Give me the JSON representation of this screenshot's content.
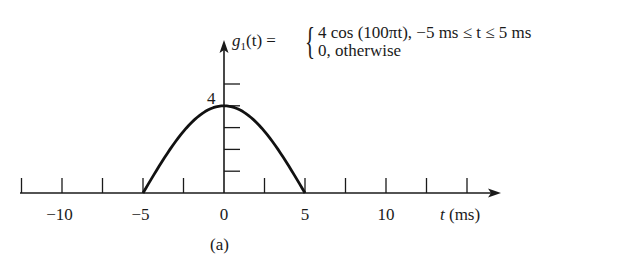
{
  "chart_data": {
    "type": "line",
    "title": "",
    "caption": "(a)",
    "xlabel": "t (ms)",
    "ylabel": "g1(t)",
    "formula": {
      "lhs": "g1(t) =",
      "cases": [
        "4 cos (100πt), −5 ms ≤ t ≤ 5 ms",
        "0, otherwise"
      ]
    },
    "x_ticks": [
      -12.5,
      -10,
      -7.5,
      -5,
      -2.5,
      0,
      2.5,
      5,
      7.5,
      10,
      12.5,
      15
    ],
    "x_tick_labels": [
      "−10",
      "−5",
      "0",
      "5",
      "10"
    ],
    "x_tick_label_values": [
      -10,
      -5,
      0,
      5,
      10
    ],
    "y_ticks": [
      1,
      2,
      3,
      4,
      5
    ],
    "y_tick_labels": [
      "4"
    ],
    "xlim": [
      -12.5,
      16.5
    ],
    "ylim": [
      0,
      6.8
    ],
    "series": [
      {
        "name": "g1(t)",
        "x": [
          -12.5,
          -5,
          -4,
          -3,
          -2,
          -1,
          0,
          1,
          2,
          3,
          4,
          5,
          16.5
        ],
        "values": [
          0,
          0,
          1.236,
          2.351,
          3.236,
          3.804,
          4,
          3.804,
          3.236,
          2.351,
          1.236,
          0,
          0
        ]
      }
    ],
    "grid": false,
    "legend": null
  },
  "labels": {
    "y_peak": "4",
    "x_axis_title": "(ms)",
    "x_axis_var": "t",
    "caption": "(a)",
    "formula_lhs_g": "g",
    "formula_lhs_sub": "1",
    "formula_lhs_rest": "(t) =",
    "formula_case1": "4 cos (100πt), −5 ms ≤ t ≤ 5 ms",
    "formula_case2": "0, otherwise"
  }
}
